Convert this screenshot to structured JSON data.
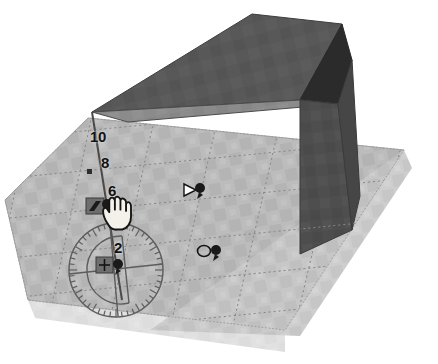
{
  "app": {
    "name": "3D Modeling Viewport",
    "scene_title": "Extruded box on textured ground plane"
  },
  "viewport": {
    "width": 438,
    "height": 364,
    "background_color": "#ffffff",
    "ground_plane": {
      "name": "ground-plane",
      "fill_color": "#b9b9b9",
      "grid_color": "#8f8f8f",
      "grid_style": "dotted",
      "outline_color": "#9a9a9a"
    },
    "box": {
      "name": "extruded-box",
      "top_face_color": "#585858",
      "band_face_color": "#8a8a8a",
      "front_face_color": "#6d6d6d",
      "right_face_color": "#4e4e4e",
      "shadow_face_color": "#2d2d2d",
      "edge_color": "#3d3d3d"
    }
  },
  "ruler": {
    "name": "measurement-ruler",
    "axis_color": "#4a4a4a",
    "label_color": "#121212",
    "ticks": [
      {
        "value": "10",
        "x": 90,
        "y": 136
      },
      {
        "value": "8",
        "x": 100,
        "y": 161
      },
      {
        "value": "6",
        "x": 107,
        "y": 188
      },
      {
        "value": "4",
        "x": 115,
        "y": 212
      },
      {
        "value": "2",
        "x": 113,
        "y": 244
      }
    ],
    "tick_dot_color": "#3a3a3a"
  },
  "protractor": {
    "name": "protractor-tool",
    "stroke_color": "#5f5f5f",
    "center_x": 116,
    "center_y": 270,
    "outer_radius": 47,
    "inner_radius": 34,
    "tick_count": 48,
    "label": "Protractor / Rotate"
  },
  "markers": [
    {
      "name": "inference-marker-endpoint",
      "icon": "square-chip-icon",
      "glyph": "◨",
      "x": 88,
      "y": 200,
      "color": "#1b1b1b",
      "chip_color": "#6e6e6e"
    },
    {
      "name": "inference-marker-midpoint",
      "icon": "triangle-marker-icon",
      "glyph": "▷",
      "x": 183,
      "y": 185,
      "color": "#171717"
    },
    {
      "name": "inference-marker-center",
      "icon": "circle-marker-icon",
      "glyph": "○",
      "x": 199,
      "y": 246,
      "color": "#171717"
    },
    {
      "name": "inference-marker-move",
      "icon": "move-crosshair-icon",
      "glyph": "✚",
      "x": 98,
      "y": 259,
      "color": "#1b1b1b",
      "chip_color": "#6e6e6e"
    }
  ],
  "pins": [
    {
      "name": "pin-icon-midpoint",
      "x": 199,
      "y": 185
    },
    {
      "name": "pin-icon-center",
      "x": 215,
      "y": 247
    },
    {
      "name": "pin-icon-move",
      "x": 113,
      "y": 263
    },
    {
      "name": "pin-icon-endpoint",
      "x": 104,
      "y": 203
    }
  ],
  "cursor": {
    "name": "hand-cursor",
    "icon": "hand-cursor-icon",
    "x": 104,
    "y": 198,
    "fill_color": "#f4f0ea",
    "stroke_color": "#1c1c1c",
    "label": "Hand / Orbit cursor"
  }
}
